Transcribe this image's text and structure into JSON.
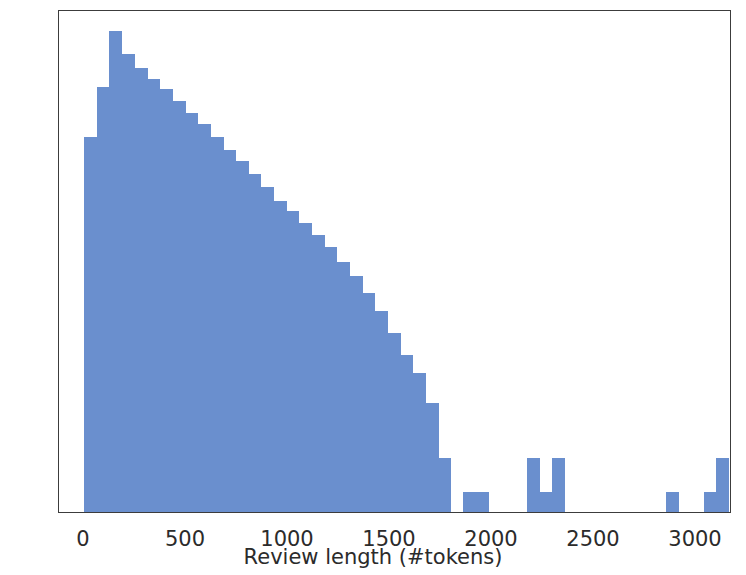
{
  "chart_data": {
    "type": "bar",
    "title": "",
    "subtitle": "",
    "xlabel": "Review length (#tokens)",
    "ylabel": "",
    "yscale": "log",
    "grid": false,
    "legend": null,
    "xlim": [
      -20,
      3280
    ],
    "ylim": [
      0.6,
      17000
    ],
    "xticks": [
      0,
      500,
      1000,
      1500,
      2000,
      2500,
      3000
    ],
    "xtick_labels": [
      "0",
      "500",
      "1000",
      "1500",
      "2000",
      "2500",
      "3000"
    ],
    "yticks": [
      1,
      10,
      100,
      1000,
      10000
    ],
    "ytick_labels": [
      "10⁰",
      "10¹",
      "10²",
      "10³",
      "10⁴"
    ],
    "ytick_mantissas": [
      "0",
      "1",
      "2",
      "3",
      "4"
    ],
    "bin_width": 62,
    "bar_color": "#6a8fce",
    "axis_color": "#3c3c3c",
    "bin_starts": [
      0,
      62,
      124,
      186,
      248,
      310,
      372,
      434,
      496,
      558,
      620,
      682,
      744,
      806,
      868,
      930,
      992,
      1054,
      1116,
      1178,
      1240,
      1302,
      1364,
      1426,
      1488,
      1550,
      1612,
      1674,
      1736,
      1798,
      1860,
      1922,
      1984,
      2046,
      2108,
      2170,
      2232,
      2294,
      2356,
      2418,
      2480,
      2542,
      2604,
      2666,
      2728,
      2790,
      2852,
      2914,
      2976,
      3038,
      3100,
      3162
    ],
    "values": [
      1300,
      3600,
      11000,
      7000,
      5200,
      4200,
      3400,
      2700,
      2100,
      1700,
      1300,
      1000,
      800,
      620,
      470,
      360,
      290,
      230,
      180,
      140,
      105,
      78,
      56,
      39,
      25,
      16,
      11,
      6,
      2,
      0,
      1,
      1,
      0,
      0,
      0,
      2,
      1,
      2,
      0,
      0,
      0,
      0,
      0,
      0,
      0,
      0,
      1,
      0,
      0,
      1,
      2,
      0
    ],
    "tail_annotations": [
      {
        "bin_start": 1674,
        "value": 6
      },
      {
        "bin_start": 1736,
        "value": 2
      },
      {
        "bin_start": 1860,
        "value": 1
      },
      {
        "bin_start": 1922,
        "value": 1
      },
      {
        "bin_start": 2108,
        "value": 2
      },
      {
        "bin_start": 2170,
        "value": 1
      },
      {
        "bin_start": 2294,
        "value": 2
      },
      {
        "bin_start": 2852,
        "value": 1
      },
      {
        "bin_start": 3100,
        "value": 1
      },
      {
        "bin_start": 3162,
        "value": 2
      }
    ]
  }
}
